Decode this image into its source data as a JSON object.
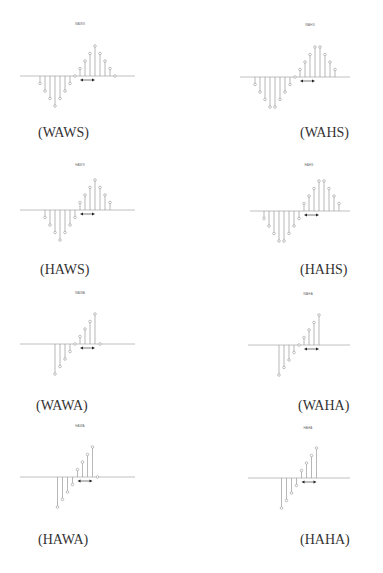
{
  "figure": {
    "panels": [
      {
        "id": "WAWS",
        "title": "WAWS",
        "caption": "(WAWS)"
      },
      {
        "id": "WAHS",
        "title": "WAHS",
        "caption": "(WAHS)"
      },
      {
        "id": "HAWS",
        "title": "HAWS",
        "caption": "(HAWS)"
      },
      {
        "id": "HAHS",
        "title": "HAHS",
        "caption": "(HAHS)"
      },
      {
        "id": "WAWA",
        "title": "WAWA",
        "caption": "(WAWA)"
      },
      {
        "id": "WAHA",
        "title": "WAHA",
        "caption": "(WAHA)"
      },
      {
        "id": "HAWA",
        "title": "HAWA",
        "caption": "(HAWA)"
      },
      {
        "id": "HAHA",
        "title": "HAHA",
        "caption": "(HAHA)"
      }
    ],
    "footer_text": ""
  },
  "chart_data": [
    {
      "type": "stem",
      "title": "WAWS",
      "caption": "(WAWS)",
      "values": [
        -0.25,
        -0.5,
        -0.75,
        -1,
        -0.75,
        -0.5,
        -0.25,
        0,
        0.25,
        0.5,
        0.75,
        1,
        0.75,
        0.5,
        0.25,
        0
      ],
      "arrow": {
        "from": 8,
        "to": 11
      },
      "color": "#999999"
    },
    {
      "type": "stem",
      "title": "WAHS",
      "caption": "(WAHS)",
      "values": [
        -0.25,
        -0.5,
        -0.75,
        -1,
        -1,
        -0.75,
        -0.5,
        -0.25,
        0,
        0.25,
        0.5,
        0.75,
        1,
        1,
        0.75,
        0.5,
        0.25
      ],
      "arrow": {
        "from": 9,
        "to": 12
      },
      "color": "#999999"
    },
    {
      "type": "stem",
      "title": "HAWS",
      "caption": "(HAWS)",
      "values": [
        -0.25,
        -0.5,
        -0.75,
        -1,
        -0.75,
        -0.5,
        -0.25,
        0.25,
        0.5,
        0.75,
        1,
        0.75,
        0.5,
        0.25
      ],
      "arrow": {
        "from": 7,
        "to": 10
      },
      "color": "#999999"
    },
    {
      "type": "stem",
      "title": "HAHS",
      "caption": "(HAHS)",
      "values": [
        -0.25,
        -0.5,
        -0.75,
        -1,
        -1,
        -0.75,
        -0.5,
        -0.25,
        0.25,
        0.5,
        0.75,
        1,
        1,
        0.75,
        0.5,
        0.25
      ],
      "arrow": {
        "from": 8,
        "to": 11
      },
      "color": "#999999"
    },
    {
      "type": "stem",
      "title": "WAWA",
      "caption": "(WAWA)",
      "values": [
        -1,
        -0.75,
        -0.5,
        -0.25,
        0,
        0.25,
        0.5,
        0.75,
        1,
        0
      ],
      "arrow": {
        "from": 5,
        "to": 8
      },
      "color": "#999999"
    },
    {
      "type": "stem",
      "title": "WAHA",
      "caption": "(WAHA)",
      "values": [
        -1,
        -0.75,
        -0.5,
        -0.25,
        0,
        0.25,
        0.5,
        0.75,
        1
      ],
      "arrow": {
        "from": 5,
        "to": 8
      },
      "color": "#999999"
    },
    {
      "type": "stem",
      "title": "HAWA",
      "caption": "(HAWA)",
      "values": [
        -1,
        -0.75,
        -0.5,
        -0.25,
        0.25,
        0.5,
        0.75,
        1,
        0
      ],
      "arrow": {
        "from": 4,
        "to": 7
      },
      "color": "#999999"
    },
    {
      "type": "stem",
      "title": "HAHA",
      "caption": "(HAHA)",
      "values": [
        -1,
        -0.75,
        -0.5,
        -0.25,
        0.25,
        0.5,
        0.75,
        1
      ],
      "arrow": {
        "from": 4,
        "to": 7
      },
      "color": "#999999"
    }
  ]
}
